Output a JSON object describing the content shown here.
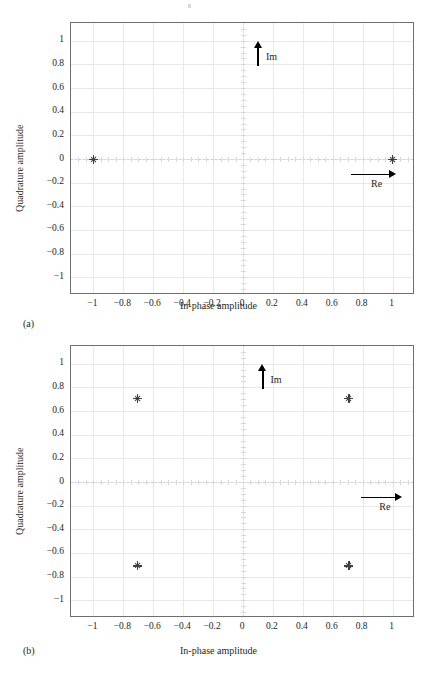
{
  "figure": {
    "subcaption_a": "(a)",
    "subcaption_b": "(b)"
  },
  "axes": {
    "xlabel": "In-phase amplitude",
    "ylabel": "Quadrature amplitude",
    "xticks": [
      "−1",
      "−0.8",
      "−0.6",
      "−0.4",
      "−0.2",
      "0",
      "0.2",
      "0.4",
      "0.6",
      "0.8",
      "1"
    ],
    "xtick_values": [
      -1,
      -0.8,
      -0.6,
      -0.4,
      -0.2,
      0,
      0.2,
      0.4,
      0.6,
      0.8,
      1
    ],
    "yticks": [
      "1",
      "0.8",
      "0.6",
      "0.4",
      "0.2",
      "0",
      "−0.2",
      "−0.4",
      "−0.6",
      "−0.8",
      "−1"
    ],
    "ytick_values": [
      1,
      0.8,
      0.6,
      0.4,
      0.2,
      0,
      -0.2,
      -0.4,
      -0.6,
      -0.8,
      -1
    ],
    "xlim": [
      -1.15,
      1.15
    ],
    "ylim": [
      -1.15,
      1.15
    ],
    "grid": true,
    "frame_color": "#6d6e71",
    "grid_color": "#e8e9ea",
    "zero_axis_color": "#d0d1d2"
  },
  "annotations": {
    "im_label": "Im",
    "re_label": "Re"
  },
  "chart_data": [
    {
      "type": "scatter",
      "id": "panel-a",
      "title": "",
      "subcaption": "(a)",
      "xlabel": "In-phase amplitude",
      "ylabel": "Quadrature amplitude",
      "xlim": [
        -1.15,
        1.15
      ],
      "ylim": [
        -1.15,
        1.15
      ],
      "grid": true,
      "legend": "none",
      "marker": "plus-star",
      "marker_color": "#404040",
      "series": [
        {
          "name": "BPSK constellation",
          "points": [
            {
              "x": -1,
              "y": 0
            },
            {
              "x": 1,
              "y": 0
            }
          ]
        }
      ],
      "annotations": [
        {
          "text": "Im",
          "type": "arrow-up",
          "x": 0.1,
          "y_from": 0.79,
          "y_to": 1.0
        },
        {
          "text": "Re",
          "type": "arrow-right",
          "y": -0.13,
          "x_from": 0.72,
          "x_to": 1.02
        }
      ]
    },
    {
      "type": "scatter",
      "id": "panel-b",
      "title": "",
      "subcaption": "(b)",
      "xlabel": "In-phase amplitude",
      "ylabel": "Quadrature amplitude",
      "xlim": [
        -1.15,
        1.15
      ],
      "ylim": [
        -1.15,
        1.15
      ],
      "grid": true,
      "legend": "none",
      "marker": "plus-star",
      "marker_color": "#404040",
      "series": [
        {
          "name": "QPSK constellation",
          "points": [
            {
              "x": -0.707,
              "y": 0.707
            },
            {
              "x": 0.707,
              "y": 0.707
            },
            {
              "x": -0.707,
              "y": -0.707
            },
            {
              "x": 0.707,
              "y": -0.707
            }
          ]
        }
      ],
      "annotations": [
        {
          "text": "Im",
          "type": "arrow-up",
          "x": 0.13,
          "y_from": 0.79,
          "y_to": 1.0
        },
        {
          "text": "Re",
          "type": "arrow-right",
          "y": -0.13,
          "x_from": 0.79,
          "x_to": 1.06
        }
      ]
    }
  ]
}
